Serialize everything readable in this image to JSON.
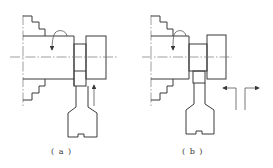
{
  "figures": [
    {
      "id": "a",
      "caption": "( a )",
      "description": "Turning operation: chuck with stepped jaws holding workpiece, tool moving radially (feed arrow upward)",
      "elements": [
        "chuck-jaws",
        "workpiece",
        "centerline",
        "rotation-arrow",
        "cutting-tool",
        "feed-arrow-up"
      ]
    },
    {
      "id": "b",
      "caption": "( b )",
      "description": "Turning operation: chuck with stepped jaws holding workpiece, tool with bidirectional axial feed arrows",
      "elements": [
        "chuck-jaws",
        "workpiece",
        "centerline",
        "rotation-arrow",
        "cutting-tool",
        "feed-arrow-left",
        "feed-arrow-right"
      ]
    }
  ],
  "colors": {
    "line": "#3a3a3a",
    "centerline": "#777777",
    "background": "#ffffff"
  }
}
